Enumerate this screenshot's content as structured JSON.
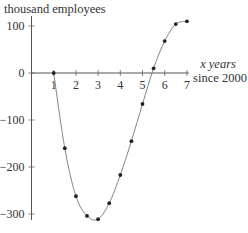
{
  "chart_data": {
    "type": "line",
    "title": "",
    "ylabel": "thousand employees",
    "xlabel_line1": "x years",
    "xlabel_line2": "since 2000",
    "xlabel": "x years since 2000",
    "xlim": [
      0,
      7
    ],
    "ylim": [
      -300,
      100
    ],
    "x_ticks": [
      1,
      2,
      3,
      4,
      5,
      6,
      7
    ],
    "x_tick_labels": [
      "1",
      "2",
      "3",
      "4",
      "5",
      "6",
      "7"
    ],
    "y_ticks": [
      100,
      0,
      -100,
      -200,
      -300
    ],
    "y_tick_labels": [
      "100",
      "0",
      "−100",
      "−200",
      "−300"
    ],
    "grid": false,
    "legend": null,
    "series": [
      {
        "name": "employees",
        "style": "smooth curve with dot markers",
        "x": [
          1,
          1.5,
          2,
          2.5,
          3,
          3.5,
          4,
          4.5,
          5,
          5.5,
          6,
          6.5,
          7
        ],
        "values": [
          0,
          -160,
          -262,
          -304,
          -311,
          -277,
          -217,
          -145,
          -66,
          10,
          68,
          104,
          110
        ]
      }
    ]
  }
}
